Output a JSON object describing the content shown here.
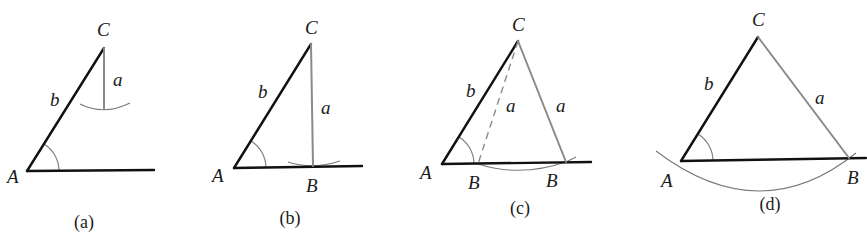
{
  "figure": {
    "colors": {
      "dark_line": "#111111",
      "grey_line": "#8a8a8a",
      "arc": "#7a7a7a",
      "text": "#1a1a1a"
    },
    "panels": [
      {
        "id": "a",
        "caption": "(a)",
        "caption_pos": [
          84,
          228
        ],
        "vertices": {
          "A": [
            27,
            171
          ],
          "C": [
            104,
            48
          ]
        },
        "base_end": [
          154,
          170
        ],
        "segments": [
          {
            "from": [
              27,
              171
            ],
            "to": [
              104,
              48
            ],
            "style": "dark",
            "name": "side-b"
          },
          {
            "from": [
              27,
              171
            ],
            "to": [
              154,
              170
            ],
            "style": "dark",
            "name": "base-ray"
          },
          {
            "from": [
              104,
              48
            ],
            "to": [
              104,
              109
            ],
            "style": "grey",
            "name": "side-a"
          }
        ],
        "arcs": [
          {
            "d": "M 80 104 Q 104 116 130 103",
            "name": "swing-arc"
          },
          {
            "d": "M 59 171 A 32 32 0 0 0 44 144",
            "name": "angle-A-arc"
          }
        ],
        "labels": [
          {
            "text": "C",
            "pos": [
              97,
              36
            ],
            "name": "label-C"
          },
          {
            "text": "b",
            "pos": [
              50,
              106
            ],
            "name": "label-b"
          },
          {
            "text": "a",
            "pos": [
              113,
              86
            ],
            "name": "label-a"
          },
          {
            "text": "A",
            "pos": [
              7,
              183
            ],
            "name": "label-A"
          }
        ]
      },
      {
        "id": "b",
        "caption": "(b)",
        "caption_pos": [
          290,
          224
        ],
        "vertices": {
          "A": [
            234,
            168
          ],
          "B": [
            313,
            166
          ],
          "C": [
            311,
            44
          ]
        },
        "segments": [
          {
            "from": [
              234,
              168
            ],
            "to": [
              311,
              44
            ],
            "style": "dark",
            "name": "side-b"
          },
          {
            "from": [
              234,
              168
            ],
            "to": [
              362,
              166
            ],
            "style": "dark",
            "name": "base-ray"
          },
          {
            "from": [
              311,
              44
            ],
            "to": [
              313,
              166
            ],
            "style": "grey",
            "name": "side-a"
          }
        ],
        "arcs": [
          {
            "d": "M 288 162 Q 313 170 340 161",
            "name": "swing-arc"
          },
          {
            "d": "M 266 168 A 32 32 0 0 0 251 141",
            "name": "angle-A-arc"
          }
        ],
        "labels": [
          {
            "text": "C",
            "pos": [
              305,
              34
            ],
            "name": "label-C"
          },
          {
            "text": "b",
            "pos": [
              258,
              98
            ],
            "name": "label-b"
          },
          {
            "text": "a",
            "pos": [
              321,
              114
            ],
            "name": "label-a"
          },
          {
            "text": "A",
            "pos": [
              212,
              182
            ],
            "name": "label-A"
          },
          {
            "text": "B",
            "pos": [
              306,
              192
            ],
            "name": "label-B"
          }
        ]
      },
      {
        "id": "c",
        "caption": "(c)",
        "caption_pos": [
          520,
          214
        ],
        "vertices": {
          "A": [
            442,
            164
          ],
          "B1": [
            478,
            164
          ],
          "B2": [
            566,
            162
          ],
          "C": [
            518,
            41
          ]
        },
        "segments": [
          {
            "from": [
              442,
              164
            ],
            "to": [
              518,
              41
            ],
            "style": "dark",
            "name": "side-b"
          },
          {
            "from": [
              442,
              164
            ],
            "to": [
              591,
              162
            ],
            "style": "dark",
            "name": "base-ray"
          },
          {
            "from": [
              518,
              41
            ],
            "to": [
              566,
              162
            ],
            "style": "grey",
            "name": "side-a-second"
          },
          {
            "from": [
              518,
              41
            ],
            "to": [
              478,
              164
            ],
            "style": "dash",
            "name": "side-a-first-dashed"
          }
        ],
        "arcs": [
          {
            "d": "M 478 164 Q 522 178 568 161 L 576 157",
            "name": "swing-arc"
          },
          {
            "d": "M 474 164 A 32 32 0 0 0 459 137",
            "name": "angle-A-arc"
          }
        ],
        "labels": [
          {
            "text": "C",
            "pos": [
              512,
              31
            ],
            "name": "label-C"
          },
          {
            "text": "b",
            "pos": [
              466,
              97
            ],
            "name": "label-b"
          },
          {
            "text": "a",
            "pos": [
              506,
              112
            ],
            "name": "label-a-dashed"
          },
          {
            "text": "a",
            "pos": [
              556,
              112
            ],
            "name": "label-a"
          },
          {
            "text": "A",
            "pos": [
              420,
              179
            ],
            "name": "label-A"
          },
          {
            "text": "B",
            "pos": [
              468,
              189
            ],
            "name": "label-B1"
          },
          {
            "text": "B",
            "pos": [
              546,
              187
            ],
            "name": "label-B2"
          }
        ]
      },
      {
        "id": "d",
        "caption": "(d)",
        "caption_pos": [
          770,
          210
        ],
        "vertices": {
          "A": [
            681,
            161
          ],
          "B": [
            849,
            158
          ],
          "C": [
            758,
            37
          ]
        },
        "segments": [
          {
            "from": [
              681,
              161
            ],
            "to": [
              758,
              37
            ],
            "style": "dark",
            "name": "side-b"
          },
          {
            "from": [
              681,
              161
            ],
            "to": [
              866,
              158
            ],
            "style": "dark",
            "name": "base-ray"
          },
          {
            "from": [
              758,
              37
            ],
            "to": [
              849,
              158
            ],
            "style": "grey",
            "name": "side-a"
          }
        ],
        "arcs": [
          {
            "d": "M 656 151 Q 760 230 856 153",
            "name": "swing-arc"
          },
          {
            "d": "M 713 161 A 32 32 0 0 0 698 134",
            "name": "angle-A-arc"
          }
        ],
        "labels": [
          {
            "text": "C",
            "pos": [
              752,
              26
            ],
            "name": "label-C"
          },
          {
            "text": "b",
            "pos": [
              704,
              90
            ],
            "name": "label-b"
          },
          {
            "text": "a",
            "pos": [
              815,
              104
            ],
            "name": "label-a"
          },
          {
            "text": "A",
            "pos": [
              661,
              187
            ],
            "name": "label-A"
          },
          {
            "text": "B",
            "pos": [
              847,
              184
            ],
            "name": "label-B"
          }
        ]
      }
    ]
  }
}
